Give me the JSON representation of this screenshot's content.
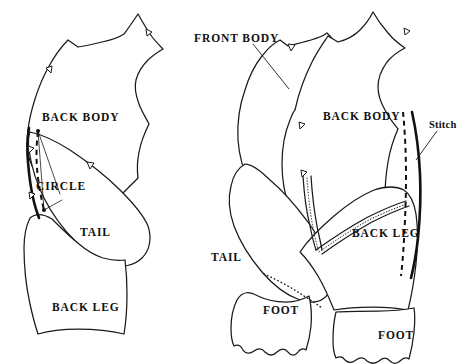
{
  "figure": {
    "background_color": "#ffffff",
    "line_color": "#1a1a1a",
    "width": 473,
    "height": 364
  },
  "labels": {
    "left_back_body": "BACK BODY",
    "left_circle": "CIRCLE",
    "left_tail": "TAIL",
    "left_back_leg": "BACK LEG",
    "right_front_body": "FRONT BODY",
    "right_back_body": "BACK BODY",
    "right_stitch": "Stitch",
    "right_tail": "TAIL",
    "right_back_leg": "BACK LEG",
    "right_foot_left": "FOOT",
    "right_foot_right": "FOOT"
  },
  "panels": {
    "left": {
      "name": "flat-pattern-panel",
      "pieces": [
        "BACK BODY",
        "TAIL",
        "BACK LEG"
      ],
      "markings": [
        "CIRCLE",
        "dashed seam line",
        "notches"
      ]
    },
    "right": {
      "name": "assembled-pattern-panel",
      "pieces": [
        "FRONT BODY",
        "BACK BODY",
        "TAIL",
        "BACK LEG",
        "FOOT",
        "FOOT"
      ],
      "markings": [
        "Stitch",
        "dashed seam line",
        "dotted fold line",
        "notches"
      ]
    }
  }
}
